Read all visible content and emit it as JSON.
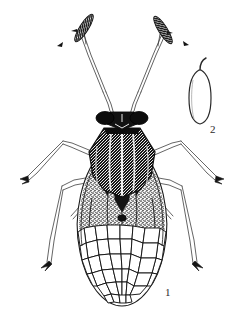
{
  "plate": {
    "kind": "scientific-illustration",
    "medium": "ink line drawing, stippled",
    "background_color": "#ffffff",
    "ink_color": "#1a1a1a",
    "width": 244,
    "height": 326,
    "figures": [
      {
        "number": "1",
        "subject": "adult bug, dorsal view",
        "label_x": 165,
        "label_y": 294,
        "parts": [
          "antennae",
          "compound eyes",
          "head",
          "pronotum",
          "scutellum",
          "hemelytra",
          "membrane with reticulate cells",
          "legs",
          "tarsal claws"
        ]
      },
      {
        "number": "2",
        "subject": "egg with operculum",
        "label_x": 213,
        "label_y": 130,
        "parts": [
          "egg body",
          "operculum neck"
        ]
      }
    ]
  },
  "figure1_label": "1",
  "figure2_label": "2"
}
